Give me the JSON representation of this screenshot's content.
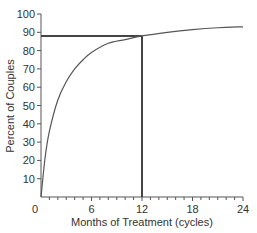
{
  "chart_data": {
    "type": "line",
    "title": "",
    "xlabel": "Months of Treatment (cycles)",
    "ylabel": "Percent of Couples",
    "xlim": [
      0,
      24
    ],
    "ylim": [
      0,
      100
    ],
    "x_ticks": [
      "0",
      "6",
      "12",
      "18",
      "24"
    ],
    "y_ticks": [
      "10",
      "20",
      "30",
      "40",
      "50",
      "60",
      "70",
      "80",
      "90",
      "100"
    ],
    "grid": false,
    "legend": null,
    "series": [
      {
        "name": "Cumulative pregnancy rate",
        "x": [
          0,
          0.5,
          1,
          2,
          3,
          4,
          5,
          6,
          8,
          10,
          12,
          15,
          18,
          21,
          24
        ],
        "values": [
          0,
          22,
          36,
          53,
          63,
          70,
          75,
          79,
          84,
          86,
          88,
          90,
          91.5,
          92.5,
          93
        ]
      }
    ],
    "annotations": [
      {
        "type": "hline",
        "y": 88,
        "x_from": 0,
        "x_to": 12
      },
      {
        "type": "vline",
        "x": 12,
        "y_from": 0,
        "y_to": 88
      }
    ]
  }
}
